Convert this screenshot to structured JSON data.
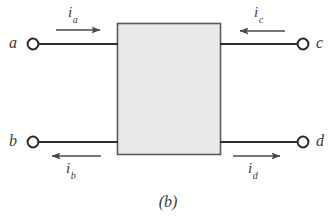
{
  "figure": {
    "caption": "(b)",
    "colors": {
      "background": "#ffffff",
      "wire": "#2b2b2b",
      "arrow": "#4a4a4a",
      "box_fill": "#e9e9e9",
      "box_stroke": "#5a5a5a",
      "terminal_fill": "#ffffff",
      "terminal_stroke": "#2b2b2b",
      "text": "#3a3a3a"
    }
  },
  "block": {
    "name": "two-port-network-block",
    "x": 117,
    "y": 23,
    "width": 104,
    "height": 132
  },
  "terminals": [
    {
      "id": "a",
      "label": "a",
      "label_x": 10,
      "label_y": 36,
      "cx": 33,
      "cy": 44,
      "r": 5.5
    },
    {
      "id": "c",
      "label": "c",
      "label_x": 316,
      "label_y": 36,
      "cx": 303,
      "cy": 44,
      "r": 5.5
    },
    {
      "id": "b",
      "label": "b",
      "label_x": 10,
      "label_y": 134,
      "cx": 33,
      "cy": 142,
      "r": 5.5
    },
    {
      "id": "d",
      "label": "d",
      "label_x": 316,
      "label_y": 134,
      "cx": 303,
      "cy": 142,
      "r": 5.5
    }
  ],
  "wires": [
    {
      "id": "wire-a",
      "x1": 39,
      "y1": 44,
      "x2": 117,
      "y2": 44
    },
    {
      "id": "wire-c",
      "x1": 221,
      "y1": 44,
      "x2": 297,
      "y2": 44
    },
    {
      "id": "wire-b",
      "x1": 39,
      "y1": 142,
      "x2": 117,
      "y2": 142
    },
    {
      "id": "wire-d",
      "x1": 221,
      "y1": 142,
      "x2": 297,
      "y2": 142
    }
  ],
  "currents": [
    {
      "id": "ia",
      "symbol": "i",
      "subscript": "a",
      "direction": "right",
      "description": "current into port a",
      "arrow": {
        "x1": 56,
        "y1": 30,
        "x2": 101,
        "y2": 30
      },
      "label_x": 68,
      "label_y": 5
    },
    {
      "id": "ic",
      "symbol": "i",
      "subscript": "c",
      "direction": "left",
      "description": "current into port c",
      "arrow": {
        "x1": 285,
        "y1": 31,
        "x2": 239,
        "y2": 31
      },
      "label_x": 254,
      "label_y": 5
    },
    {
      "id": "ib",
      "symbol": "i",
      "subscript": "b",
      "direction": "left",
      "description": "current out of port b",
      "arrow": {
        "x1": 101,
        "y1": 156,
        "x2": 51,
        "y2": 156
      },
      "label_x": 66,
      "label_y": 162
    },
    {
      "id": "id",
      "symbol": "i",
      "subscript": "d",
      "direction": "right",
      "description": "current out of port d",
      "arrow": {
        "x1": 233,
        "y1": 156,
        "x2": 281,
        "y2": 156
      },
      "label_x": 248,
      "label_y": 162
    }
  ]
}
